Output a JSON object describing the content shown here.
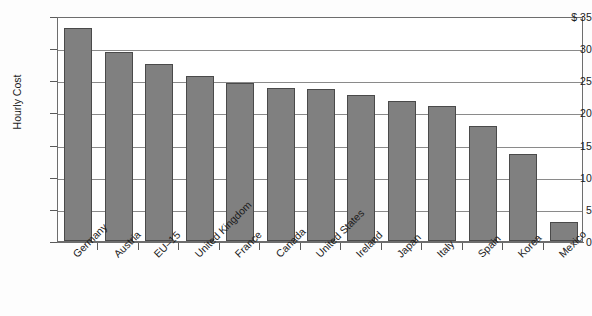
{
  "chart_data": {
    "type": "bar",
    "title": "",
    "subtitle": "",
    "xlabel": "",
    "ylabel": "Hourly Cost",
    "y_axis_prefix": "$",
    "ylim": [
      0,
      35
    ],
    "y_ticks": [
      0,
      5,
      10,
      15,
      20,
      25,
      30,
      35
    ],
    "y_tick_labels": [
      "0",
      "5",
      "10",
      "15",
      "20",
      "25",
      "30",
      "$ 35"
    ],
    "grid": "horizontal",
    "legend": "none",
    "bar_color": "#808080",
    "bar_border_color": "#4a4a4a",
    "axis_color": "#6d6d6d",
    "categories": [
      "Germany",
      "Austria",
      "EU–15",
      "United Kingdom",
      "France",
      "Canada",
      "United States",
      "Ireland",
      "Japan",
      "Italy",
      "Spain",
      "Korea",
      "Mexico"
    ],
    "values": [
      33.2,
      29.4,
      27.6,
      25.7,
      24.6,
      23.8,
      23.6,
      22.7,
      21.8,
      21.0,
      17.9,
      13.6,
      3.0
    ],
    "series": [
      {
        "name": "Hourly Cost",
        "values": [
          33.2,
          29.4,
          27.6,
          25.7,
          24.6,
          23.8,
          23.6,
          22.7,
          21.8,
          21.0,
          17.9,
          13.6,
          3.0
        ]
      }
    ]
  }
}
